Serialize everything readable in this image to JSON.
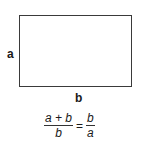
{
  "diagram": {
    "labels": {
      "side_a": "a",
      "side_b": "b"
    },
    "equation": {
      "left": {
        "numerator": "a + b",
        "denominator": "b"
      },
      "equals": "=",
      "right": {
        "numerator": "b",
        "denominator": "a"
      }
    }
  }
}
